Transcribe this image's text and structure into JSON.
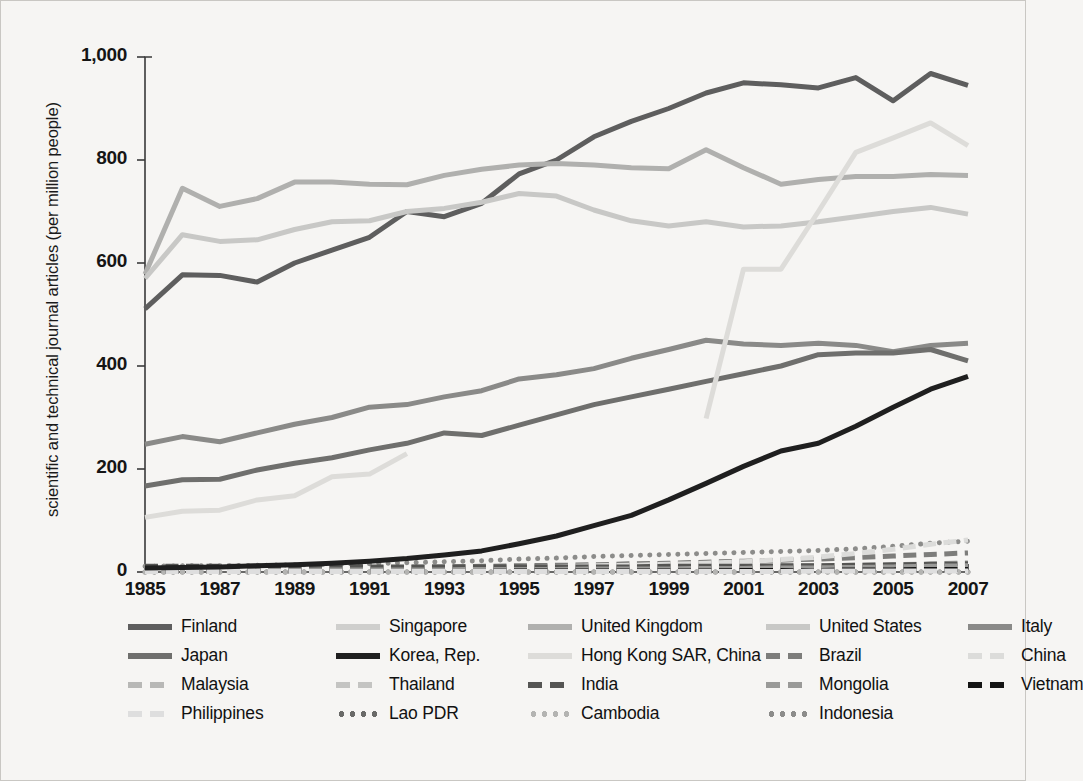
{
  "axes": {
    "ylabel": "scientific and technical journal articles (per million people)",
    "yticks": [
      "0",
      "200",
      "400",
      "600",
      "800",
      "1,000"
    ],
    "xticks": [
      "1985",
      "1987",
      "1989",
      "1991",
      "1993",
      "1995",
      "1997",
      "1999",
      "2001",
      "2003",
      "2005",
      "2007"
    ]
  },
  "legend": {
    "rows": [
      [
        "Finland",
        "Singapore",
        "United Kingdom",
        "United States",
        "Italy"
      ],
      [
        "Japan",
        "Korea, Rep.",
        "Hong Kong SAR, China",
        "Brazil",
        "China"
      ],
      [
        "Malaysia",
        "Thailand",
        "India",
        "Mongolia",
        "Vietnam"
      ],
      [
        "Philippines",
        "Lao PDR",
        "Cambodia",
        "Indonesia"
      ]
    ]
  },
  "chart_data": {
    "type": "line",
    "title": "",
    "xlabel": "",
    "ylabel": "scientific and technical journal articles (per million people)",
    "xlim": [
      1985,
      2007
    ],
    "ylim": [
      0,
      1000
    ],
    "grid": false,
    "legend_position": "bottom",
    "x": [
      1985,
      1986,
      1987,
      1988,
      1989,
      1990,
      1991,
      1992,
      1993,
      1994,
      1995,
      1996,
      1997,
      1998,
      1999,
      2000,
      2001,
      2002,
      2003,
      2004,
      2005,
      2006,
      2007
    ],
    "series": [
      {
        "name": "Finland",
        "color": "#5e5e5e",
        "style": "solid",
        "width": 5,
        "values": [
          511,
          577,
          576,
          563,
          600,
          625,
          650,
          700,
          690,
          716,
          773,
          800,
          845,
          875,
          900,
          930,
          950,
          946,
          940,
          960,
          915,
          968,
          945
        ]
      },
      {
        "name": "Singapore",
        "color": "#cfcfcd",
        "style": "solid",
        "width": 5,
        "values": [
          null,
          null,
          null,
          null,
          null,
          null,
          null,
          null,
          null,
          null,
          null,
          null,
          null,
          null,
          null,
          null,
          null,
          null,
          null,
          null,
          null,
          null,
          null
        ]
      },
      {
        "name": "United Kingdom",
        "color": "#b0b0ae",
        "style": "solid",
        "width": 5,
        "values": [
          578,
          745,
          710,
          725,
          757,
          757,
          753,
          752,
          770,
          782,
          790,
          793,
          790,
          785,
          783,
          820,
          785,
          753,
          762,
          768,
          768,
          772,
          770
        ]
      },
      {
        "name": "United States",
        "color": "#c8c8c6",
        "style": "solid",
        "width": 5,
        "values": [
          570,
          655,
          642,
          645,
          665,
          680,
          682,
          700,
          706,
          718,
          735,
          730,
          703,
          682,
          672,
          680,
          670,
          672,
          680,
          690,
          700,
          708,
          695
        ]
      },
      {
        "name": "Italy",
        "color": "#8a8a88",
        "style": "solid",
        "width": 5,
        "values": [
          248,
          263,
          253,
          270,
          287,
          300,
          320,
          325,
          340,
          352,
          375,
          383,
          395,
          415,
          432,
          450,
          443,
          440,
          444,
          440,
          428,
          440,
          444
        ]
      },
      {
        "name": "Japan",
        "color": "#6f6f6d",
        "style": "solid",
        "width": 5,
        "values": [
          167,
          179,
          180,
          198,
          211,
          222,
          237,
          250,
          270,
          265,
          285,
          305,
          325,
          340,
          355,
          370,
          385,
          400,
          422,
          425,
          425,
          432,
          410
        ]
      },
      {
        "name": "Korea, Rep.",
        "color": "#1f1f1f",
        "style": "solid",
        "width": 5,
        "values": [
          8,
          9,
          10,
          12,
          14,
          17,
          21,
          26,
          33,
          41,
          55,
          70,
          90,
          110,
          140,
          172,
          205,
          235,
          250,
          283,
          320,
          355,
          380
        ]
      },
      {
        "name": "Hong Kong SAR, China",
        "color": "#dddcd9",
        "style": "solid",
        "width": 5,
        "values": [
          106,
          118,
          120,
          140,
          148,
          185,
          190,
          230,
          null,
          null,
          null,
          null,
          null,
          null,
          null,
          298,
          588,
          588,
          700,
          815,
          843,
          872,
          828
        ]
      },
      {
        "name": "Brazil",
        "color": "#7d7d7b",
        "style": "dashed",
        "width": 5,
        "values": [
          5,
          6,
          6,
          7,
          7,
          8,
          8,
          9,
          10,
          11,
          12,
          13,
          14,
          16,
          17,
          19,
          21,
          23,
          25,
          28,
          31,
          34,
          37
        ]
      },
      {
        "name": "China",
        "color": "#dcdcda",
        "style": "dashed",
        "width": 5,
        "values": [
          3,
          3,
          4,
          4,
          5,
          5,
          6,
          6,
          7,
          8,
          9,
          10,
          12,
          13,
          15,
          17,
          20,
          24,
          29,
          36,
          44,
          54,
          62
        ]
      },
      {
        "name": "Malaysia",
        "color": "#b8b8b6",
        "style": "dashed",
        "width": 5,
        "values": [
          4,
          4,
          4,
          5,
          5,
          5,
          6,
          6,
          6,
          7,
          7,
          8,
          8,
          9,
          9,
          10,
          10,
          11,
          12,
          13,
          14,
          16,
          18
        ]
      },
      {
        "name": "Thailand",
        "color": "#c4c4c2",
        "style": "dashed",
        "width": 5,
        "values": [
          2,
          2,
          2,
          3,
          3,
          3,
          3,
          4,
          4,
          4,
          4,
          5,
          5,
          5,
          6,
          6,
          7,
          7,
          8,
          9,
          10,
          11,
          12
        ]
      },
      {
        "name": "India",
        "color": "#555553",
        "style": "dashed",
        "width": 5,
        "values": [
          11,
          11,
          11,
          11,
          11,
          11,
          10,
          10,
          10,
          10,
          10,
          10,
          10,
          10,
          11,
          11,
          11,
          12,
          12,
          13,
          14,
          15,
          16
        ]
      },
      {
        "name": "Mongolia",
        "color": "#9a9a98",
        "style": "dashed",
        "width": 5,
        "values": [
          3,
          3,
          3,
          3,
          3,
          4,
          4,
          4,
          4,
          5,
          5,
          5,
          6,
          6,
          6,
          7,
          7,
          8,
          8,
          9,
          10,
          11,
          12
        ]
      },
      {
        "name": "Vietnam",
        "color": "#141414",
        "style": "dashed",
        "width": 5,
        "values": [
          1,
          1,
          1,
          1,
          1,
          1,
          1,
          1,
          1,
          1,
          2,
          2,
          2,
          2,
          2,
          2,
          3,
          3,
          3,
          4,
          4,
          5,
          5
        ]
      },
      {
        "name": "Philippines",
        "color": "#dedede",
        "style": "dashed",
        "width": 5,
        "values": [
          1,
          1,
          1,
          1,
          1,
          1,
          1,
          1,
          1,
          1,
          1,
          1,
          1,
          1,
          1,
          1,
          1,
          1,
          2,
          2,
          2,
          2,
          2
        ]
      },
      {
        "name": "Lao PDR",
        "color": "#6a6a68",
        "style": "dotted",
        "width": 5,
        "values": [
          0,
          0,
          0,
          0,
          0,
          0,
          0,
          0,
          0,
          0,
          0,
          0,
          0,
          0,
          0,
          0,
          0,
          0,
          0,
          0,
          0,
          0,
          0
        ]
      },
      {
        "name": "Cambodia",
        "color": "#b4b4b2",
        "style": "dotted",
        "width": 5,
        "values": [
          0,
          0,
          0,
          0,
          0,
          0,
          0,
          0,
          0,
          0,
          0,
          0,
          0,
          0,
          0,
          0,
          0,
          0,
          0,
          0,
          0,
          0,
          0
        ]
      },
      {
        "name": "Indonesia",
        "color": "#8c8c8a",
        "style": "dotted",
        "width": 5,
        "values": [
          11,
          12,
          12,
          13,
          14,
          15,
          16,
          18,
          20,
          22,
          25,
          27,
          30,
          32,
          34,
          36,
          38,
          40,
          42,
          45,
          50,
          56,
          60
        ]
      }
    ]
  }
}
